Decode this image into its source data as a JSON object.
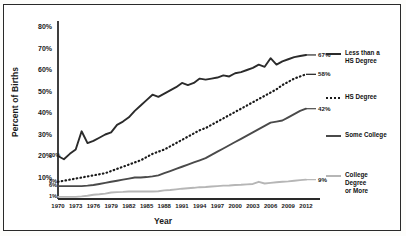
{
  "chart_data": {
    "type": "line",
    "title": "",
    "xlabel": "Year",
    "ylabel": "Percent of Births",
    "xlim": [
      1970,
      2012
    ],
    "ylim": [
      0,
      80
    ],
    "ytick_labels": [
      "10%",
      "20%",
      "30%",
      "40%",
      "50%",
      "60%",
      "70%",
      "80%"
    ],
    "ytick_values": [
      10,
      20,
      30,
      40,
      50,
      60,
      70,
      80
    ],
    "grid": false,
    "legend_position": "right",
    "xtick_labels": [
      "1970",
      "1973",
      "1976",
      "1979",
      "1982",
      "1985",
      "1988",
      "1991",
      "1994",
      "1997",
      "2000",
      "2003",
      "2006",
      "2009",
      "2012"
    ],
    "xtick_values": [
      1970,
      1973,
      1976,
      1979,
      1982,
      1985,
      1988,
      1991,
      1994,
      1997,
      2000,
      2003,
      2006,
      2009,
      2012
    ],
    "x": [
      1970,
      1971,
      1972,
      1973,
      1974,
      1975,
      1976,
      1977,
      1978,
      1979,
      1980,
      1981,
      1982,
      1983,
      1984,
      1985,
      1986,
      1987,
      1988,
      1989,
      1990,
      1991,
      1992,
      1993,
      1994,
      1995,
      1996,
      1997,
      1998,
      1999,
      2000,
      2001,
      2002,
      2003,
      2004,
      2005,
      2006,
      2007,
      2008,
      2009,
      2010,
      2011,
      2012
    ],
    "series": [
      {
        "name": "Less than a HS Degree",
        "style": "solid",
        "color": "#2b2b2b",
        "start_label": "20%",
        "end_label": "67%",
        "values": [
          20,
          18.5,
          21,
          23,
          31.5,
          26,
          27,
          28.5,
          30,
          31,
          34.5,
          36,
          38,
          41,
          43.5,
          46,
          48.5,
          47.5,
          49,
          50.5,
          52,
          54,
          53,
          54,
          56,
          55.5,
          56,
          56.5,
          57.5,
          57,
          58.5,
          59,
          60,
          61,
          62.5,
          61.5,
          65.5,
          62.5,
          64,
          65,
          66,
          66.5,
          67
        ]
      },
      {
        "name": "HS Degree",
        "style": "dotted",
        "color": "#1a1a1a",
        "start_label": "8%",
        "end_label": "58%",
        "values": [
          8,
          8.5,
          9,
          9.5,
          10,
          10.5,
          11,
          11.5,
          12,
          13,
          14,
          15,
          16,
          17,
          18,
          19.5,
          21,
          22,
          23,
          24.5,
          26,
          27.5,
          29,
          30.5,
          32,
          33,
          34.5,
          36,
          37.5,
          39,
          40.5,
          42,
          43.5,
          45,
          46.5,
          48,
          49.5,
          51,
          53,
          54.5,
          56,
          57,
          58
        ]
      },
      {
        "name": "Some College",
        "style": "solid",
        "color": "#4a4a4a",
        "start_label": "6%",
        "end_label": "42%",
        "values": [
          6,
          6,
          6,
          6,
          6,
          6.2,
          6.5,
          7,
          7.5,
          8,
          8.5,
          9,
          9.5,
          10,
          10,
          10.2,
          10.5,
          11,
          12,
          13,
          14,
          15,
          16,
          17,
          18,
          19,
          20.5,
          22,
          23.5,
          25,
          26.5,
          28,
          29.5,
          31,
          32.5,
          34,
          35.5,
          36,
          36.5,
          38,
          39.5,
          41,
          42
        ]
      },
      {
        "name": "College Degree or More",
        "style": "solid",
        "color": "#b6b6b6",
        "start_label": "1%",
        "end_label": "9%",
        "values": [
          1,
          1,
          1,
          1,
          1.2,
          1.5,
          2,
          2.2,
          2.5,
          3,
          3.2,
          3.3,
          3.5,
          3.5,
          3.5,
          3.5,
          3.5,
          3.6,
          4,
          4.2,
          4.5,
          4.8,
          5,
          5.2,
          5.5,
          5.6,
          5.8,
          6,
          6.2,
          6.3,
          6.5,
          6.6,
          6.8,
          7,
          8,
          7.2,
          7.5,
          7.8,
          8,
          8.2,
          8.5,
          8.8,
          9
        ]
      }
    ]
  },
  "legend": {
    "items": [
      {
        "label": "Less than a\nHS Degree",
        "style": "solid",
        "color": "#2b2b2b"
      },
      {
        "label": "HS Degree",
        "style": "dotted",
        "color": "#1a1a1a"
      },
      {
        "label": "Some College",
        "style": "solid",
        "color": "#4a4a4a"
      },
      {
        "label": "College\nDegree\nor More",
        "style": "solid",
        "color": "#b6b6b6"
      }
    ]
  }
}
